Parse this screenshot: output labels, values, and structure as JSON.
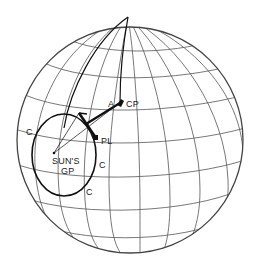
{
  "diagram": {
    "type": "globe-celestial-navigation",
    "colors": {
      "grid": "#555555",
      "ink": "#111111",
      "background": "#ffffff"
    },
    "labels": {
      "a": "A",
      "cp": "CP",
      "pl": "PL",
      "suns": "SUN'S",
      "gp": "GP",
      "c_left": "C",
      "c_right": "C",
      "c_bottom": "C"
    }
  }
}
